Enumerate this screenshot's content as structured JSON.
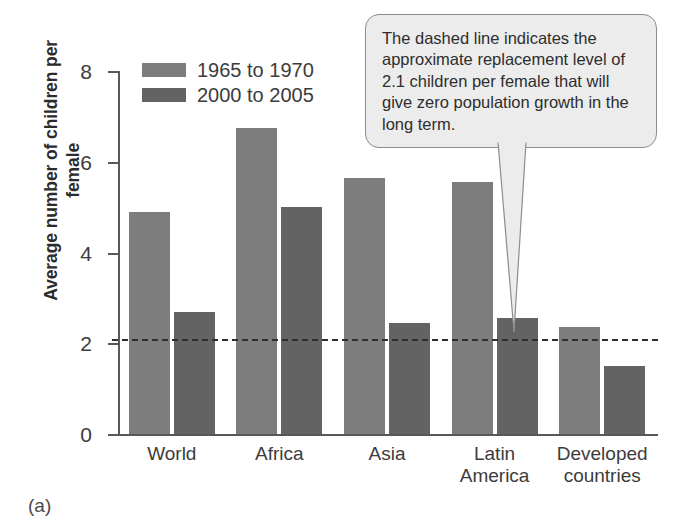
{
  "figure": {
    "caption": "(a)"
  },
  "chart_data": {
    "type": "bar",
    "title": "",
    "xlabel": "",
    "ylabel": "Average number of children\nper female",
    "categories": [
      "World",
      "Africa",
      "Asia",
      "Latin\nAmerica",
      "Developed\ncountries"
    ],
    "series": [
      {
        "name": "1965 to 1970",
        "color": "#7d7d7d",
        "values": [
          4.9,
          6.75,
          5.65,
          5.55,
          2.35
        ]
      },
      {
        "name": "2000 to 2005",
        "color": "#636363",
        "values": [
          2.7,
          5.0,
          2.45,
          2.55,
          1.5
        ]
      }
    ],
    "ylim": [
      0,
      8
    ],
    "yticks": [
      0,
      2,
      4,
      6,
      8
    ],
    "ytick_labels": [
      "0",
      "2",
      "4",
      "6",
      "8"
    ],
    "grid": false,
    "legend_position": "top-left-inside",
    "annotations": [
      {
        "name": "replacement-level-line",
        "type": "hline",
        "value": 2.1,
        "style": "dashed",
        "color": "#2e2e2e"
      },
      {
        "name": "replacement-level-callout",
        "type": "callout",
        "text": "The dashed line indicates the approximate replacement level of 2.1 children per female that will give zero population growth in the long term.",
        "points_to": 2.1
      }
    ]
  },
  "legend": {
    "items": [
      {
        "label": "1965 to 1970"
      },
      {
        "label": "2000 to 2005"
      }
    ]
  },
  "callout": {
    "text": "The dashed line indicates the approximate replacement level of 2.1 children per female that will give zero population growth in the long term."
  }
}
